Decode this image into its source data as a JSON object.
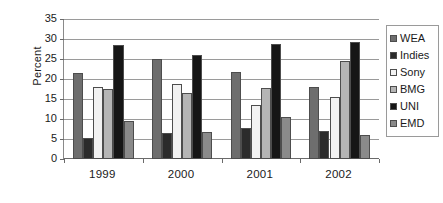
{
  "chart_data": {
    "type": "bar",
    "title": "",
    "xlabel": "",
    "ylabel": "Percent",
    "categories": [
      "1999",
      "2000",
      "2001",
      "2002"
    ],
    "ylim": [
      0,
      35
    ],
    "yticks": [
      0,
      5,
      10,
      15,
      20,
      25,
      30,
      35
    ],
    "grid": true,
    "legend_position": "right",
    "series": [
      {
        "name": "WEA",
        "color": "#6e6e6e",
        "values": [
          21.6,
          24.9,
          21.8,
          18.1
        ]
      },
      {
        "name": "Indies",
        "color": "#2b2b2b",
        "values": [
          5.3,
          6.6,
          7.8,
          7.0
        ]
      },
      {
        "name": "Sony",
        "color": "#f2f2f2",
        "values": [
          18.1,
          18.7,
          13.4,
          15.4
        ]
      },
      {
        "name": "BMG",
        "color": "#b5b5b5",
        "values": [
          17.4,
          16.6,
          17.7,
          24.4
        ]
      },
      {
        "name": "UNI",
        "color": "#161616",
        "values": [
          28.6,
          25.9,
          28.7,
          29.2
        ]
      },
      {
        "name": "EMD",
        "color": "#8a8a8a",
        "values": [
          9.4,
          6.8,
          10.6,
          5.9
        ]
      }
    ]
  },
  "legend": {
    "items": [
      {
        "label": "WEA"
      },
      {
        "label": "Indies"
      },
      {
        "label": "Sony"
      },
      {
        "label": "BMG"
      },
      {
        "label": "UNI"
      },
      {
        "label": "EMD"
      }
    ]
  }
}
